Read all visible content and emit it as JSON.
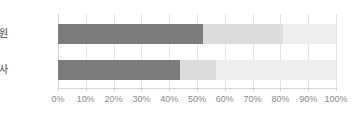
{
  "chart_data": {
    "type": "bar",
    "orientation": "horizontal",
    "stacked": true,
    "title": "",
    "subtitle": "",
    "xlabel": "",
    "ylabel": "",
    "xlim": [
      0,
      100
    ],
    "grid": true,
    "legend": "none",
    "categories": [
      "조합원",
      "일반교사"
    ],
    "tick_labels": [
      "0%",
      "10%",
      "20%",
      "30%",
      "40%",
      "50%",
      "60%",
      "70%",
      "80%",
      "90%",
      "100%"
    ],
    "tick_values": [
      0,
      10,
      20,
      30,
      40,
      50,
      60,
      70,
      80,
      90,
      100
    ],
    "series": [
      {
        "name": "series-1",
        "color": "#7c7c7c",
        "values": [
          52,
          44
        ]
      },
      {
        "name": "series-2",
        "color": "#dcdcdc",
        "values": [
          29,
          13
        ]
      },
      {
        "name": "series-3",
        "color": "#eeeeee",
        "values": [
          19,
          43
        ]
      }
    ],
    "colors": {
      "series_1": "#7c7c7c",
      "series_2": "#dcdcdc",
      "series_3": "#eeeeee",
      "gridline": "#e4e4e4",
      "axis": "#d8d8d8",
      "tick_text": "#8a8a8a",
      "category_text": "#3f3f3f",
      "background": "#ffffff"
    }
  }
}
